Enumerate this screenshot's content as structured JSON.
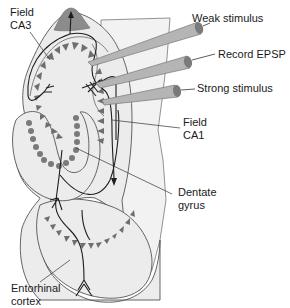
{
  "diagram": {
    "labels": {
      "field_ca3": "Field\nCA3",
      "weak_stimulus": "Weak stimulus",
      "record_epsp": "Record EPSP",
      "strong_stimulus": "Strong stimulus",
      "field_ca1": "Field\nCA1",
      "dentate_gyrus": "Dentate\ngyrus",
      "entorhinal_cortex": "Entorhinal\ncortex"
    },
    "electrodes": [
      {
        "name": "weak-stimulus-electrode",
        "label": "Weak stimulus"
      },
      {
        "name": "record-epsp-electrode",
        "label": "Record EPSP"
      },
      {
        "name": "strong-stimulus-electrode",
        "label": "Strong stimulus"
      }
    ],
    "colors": {
      "tissue_fill": "#ececec",
      "outline": "#555555",
      "neuron_fill": "#6e6e6e",
      "ca3_tip": "#8c8c8c",
      "electrode_fill": "#b5b5b5",
      "electrode_tip": "#7a7a7a",
      "axon": "#1e1e1e",
      "panel_fill": "#f2f2f2"
    }
  }
}
